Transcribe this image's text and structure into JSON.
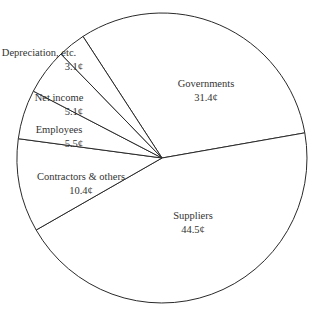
{
  "chart_data": {
    "type": "pie",
    "title": "",
    "unit": "¢",
    "categories": [
      "Governments",
      "Suppliers",
      "Contractors & others",
      "Employees",
      "Net income",
      "Depreciation, etc."
    ],
    "values": [
      31.4,
      44.5,
      10.4,
      5.5,
      5.1,
      3.1
    ],
    "value_labels": [
      "31.4¢",
      "44.5¢",
      "10.4¢",
      "5.5¢",
      "5.1¢",
      "3.1¢"
    ],
    "legend": "none (labels inside slices)",
    "colors": {
      "fill": "#ffffff",
      "stroke": "#2a2a2a",
      "text": "#333333"
    }
  },
  "labels": [
    {
      "name": "Governments",
      "value": "31.4¢"
    },
    {
      "name": "Suppliers",
      "value": "44.5¢"
    },
    {
      "name": "Contractors & others",
      "value": "10.4¢"
    },
    {
      "name": "Employees",
      "value": "5.5¢"
    },
    {
      "name": "Net income",
      "value": "5.1¢"
    },
    {
      "name": "Depreciation, etc.",
      "value": "3.1¢"
    }
  ]
}
